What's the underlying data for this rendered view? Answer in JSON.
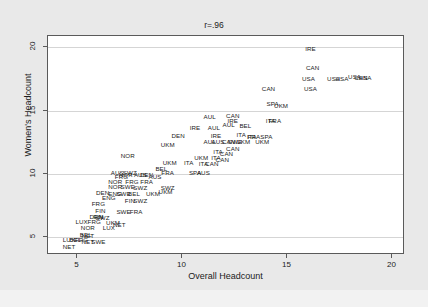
{
  "chart_data": {
    "type": "scatter",
    "title": "r=.96",
    "xlabel": "Overall Headcount",
    "ylabel": "Women's Headcount",
    "xlim": [
      3.6,
      20.6
    ],
    "ylim": [
      3.6,
      20.9
    ],
    "xticks": [
      5,
      10,
      15,
      20
    ],
    "yticks": [
      5,
      10,
      15,
      20
    ],
    "grid": true,
    "legend": "none",
    "marker_style": "text-label",
    "points": [
      {
        "label": "IRE",
        "x": 16.1,
        "y": 19.9
      },
      {
        "label": "CAN",
        "x": 16.2,
        "y": 18.4
      },
      {
        "label": "USA",
        "x": 16.0,
        "y": 17.5
      },
      {
        "label": "USA",
        "x": 17.2,
        "y": 17.5
      },
      {
        "label": "USA",
        "x": 17.6,
        "y": 17.5
      },
      {
        "label": "USA",
        "x": 18.2,
        "y": 17.7
      },
      {
        "label": "CAN",
        "x": 18.5,
        "y": 17.6
      },
      {
        "label": "USA",
        "x": 18.7,
        "y": 17.6
      },
      {
        "label": "CAN",
        "x": 14.1,
        "y": 16.7
      },
      {
        "label": "USA",
        "x": 16.1,
        "y": 16.7
      },
      {
        "label": "SPA",
        "x": 14.3,
        "y": 15.5
      },
      {
        "label": "UKM",
        "x": 14.7,
        "y": 15.4
      },
      {
        "label": "AUL",
        "x": 11.3,
        "y": 14.5
      },
      {
        "label": "CAN",
        "x": 12.4,
        "y": 14.6
      },
      {
        "label": "IRE",
        "x": 12.4,
        "y": 14.2
      },
      {
        "label": "ITA",
        "x": 14.2,
        "y": 14.2
      },
      {
        "label": "FRA",
        "x": 14.4,
        "y": 14.2
      },
      {
        "label": "IRE",
        "x": 10.6,
        "y": 13.6
      },
      {
        "label": "AUL",
        "x": 11.5,
        "y": 13.6
      },
      {
        "label": "AUL",
        "x": 12.2,
        "y": 13.9
      },
      {
        "label": "BEL",
        "x": 13.0,
        "y": 13.8
      },
      {
        "label": "DEN",
        "x": 9.8,
        "y": 13.0
      },
      {
        "label": "IRE",
        "x": 11.6,
        "y": 13.0
      },
      {
        "label": "ITA",
        "x": 12.8,
        "y": 13.1
      },
      {
        "label": "ITA",
        "x": 13.3,
        "y": 12.9
      },
      {
        "label": "FRA",
        "x": 13.4,
        "y": 12.9
      },
      {
        "label": "SPA",
        "x": 14.0,
        "y": 12.9
      },
      {
        "label": "AUL",
        "x": 11.3,
        "y": 12.5
      },
      {
        "label": "AUS",
        "x": 11.7,
        "y": 12.5
      },
      {
        "label": "CAN",
        "x": 12.2,
        "y": 12.5
      },
      {
        "label": "SWE",
        "x": 12.5,
        "y": 12.5
      },
      {
        "label": "UKM",
        "x": 12.9,
        "y": 12.5
      },
      {
        "label": "UKM",
        "x": 13.8,
        "y": 12.5
      },
      {
        "label": "UKM",
        "x": 9.3,
        "y": 12.3
      },
      {
        "label": "CAN",
        "x": 12.4,
        "y": 12.0
      },
      {
        "label": "ITA",
        "x": 11.7,
        "y": 11.7
      },
      {
        "label": "CAN",
        "x": 12.1,
        "y": 11.6
      },
      {
        "label": "NOR",
        "x": 7.4,
        "y": 11.4
      },
      {
        "label": "UKM",
        "x": 10.9,
        "y": 11.3
      },
      {
        "label": "ITA",
        "x": 11.6,
        "y": 11.3
      },
      {
        "label": "CAN",
        "x": 11.9,
        "y": 11.1
      },
      {
        "label": "UKM",
        "x": 9.4,
        "y": 10.9
      },
      {
        "label": "ITA",
        "x": 10.3,
        "y": 10.9
      },
      {
        "label": "ITA",
        "x": 11.0,
        "y": 10.8
      },
      {
        "label": "CAN",
        "x": 11.4,
        "y": 10.8
      },
      {
        "label": "BEL",
        "x": 9.0,
        "y": 10.4
      },
      {
        "label": "FRA",
        "x": 9.3,
        "y": 10.1
      },
      {
        "label": "SPA",
        "x": 10.6,
        "y": 10.1
      },
      {
        "label": "AUS",
        "x": 11.0,
        "y": 10.1
      },
      {
        "label": "AUS",
        "x": 6.9,
        "y": 10.1
      },
      {
        "label": "SWZ",
        "x": 7.5,
        "y": 10.1
      },
      {
        "label": "FRG",
        "x": 7.1,
        "y": 9.8
      },
      {
        "label": "NOR",
        "x": 7.3,
        "y": 9.9
      },
      {
        "label": "AUS",
        "x": 8.0,
        "y": 9.9
      },
      {
        "label": "DEN",
        "x": 8.3,
        "y": 9.9
      },
      {
        "label": "AUS",
        "x": 8.7,
        "y": 9.8
      },
      {
        "label": "NOR",
        "x": 6.8,
        "y": 9.4
      },
      {
        "label": "FRG",
        "x": 7.6,
        "y": 9.4
      },
      {
        "label": "FRA",
        "x": 8.3,
        "y": 9.4
      },
      {
        "label": "NOR",
        "x": 6.8,
        "y": 9.0
      },
      {
        "label": "SWE",
        "x": 7.4,
        "y": 9.0
      },
      {
        "label": "SWZ",
        "x": 8.0,
        "y": 8.9
      },
      {
        "label": "SWZ",
        "x": 9.3,
        "y": 8.9
      },
      {
        "label": "DEN",
        "x": 6.2,
        "y": 8.5
      },
      {
        "label": "ENG",
        "x": 6.8,
        "y": 8.4
      },
      {
        "label": "SWE",
        "x": 7.2,
        "y": 8.4
      },
      {
        "label": "BEL",
        "x": 7.7,
        "y": 8.4
      },
      {
        "label": "UKM",
        "x": 8.6,
        "y": 8.4
      },
      {
        "label": "UKM",
        "x": 9.2,
        "y": 8.6
      },
      {
        "label": "ENG",
        "x": 6.5,
        "y": 8.1
      },
      {
        "label": "FIN",
        "x": 7.5,
        "y": 7.9
      },
      {
        "label": "SWZ",
        "x": 8.0,
        "y": 7.9
      },
      {
        "label": "FRG",
        "x": 6.0,
        "y": 7.6
      },
      {
        "label": "FIN",
        "x": 6.1,
        "y": 7.1
      },
      {
        "label": "SWE",
        "x": 7.2,
        "y": 7.0
      },
      {
        "label": "FRA",
        "x": 7.8,
        "y": 7.0
      },
      {
        "label": "DEN",
        "x": 5.9,
        "y": 6.6
      },
      {
        "label": "FIN",
        "x": 6.0,
        "y": 6.6
      },
      {
        "label": "SWZ",
        "x": 6.2,
        "y": 6.5
      },
      {
        "label": "LUX",
        "x": 5.2,
        "y": 6.2
      },
      {
        "label": "FRG",
        "x": 5.8,
        "y": 6.2
      },
      {
        "label": "UKM",
        "x": 6.7,
        "y": 6.1
      },
      {
        "label": "NET",
        "x": 7.0,
        "y": 6.0
      },
      {
        "label": "NOR",
        "x": 5.5,
        "y": 5.7
      },
      {
        "label": "LUX",
        "x": 6.5,
        "y": 5.7
      },
      {
        "label": "BEL",
        "x": 5.4,
        "y": 5.2
      },
      {
        "label": "NET",
        "x": 5.5,
        "y": 5.1
      },
      {
        "label": "LUX",
        "x": 4.6,
        "y": 4.8
      },
      {
        "label": "BEL",
        "x": 4.9,
        "y": 4.8
      },
      {
        "label": "FRG",
        "x": 5.2,
        "y": 4.8
      },
      {
        "label": "NET",
        "x": 5.5,
        "y": 4.6
      },
      {
        "label": "SWE",
        "x": 6.0,
        "y": 4.6
      },
      {
        "label": "NET",
        "x": 4.6,
        "y": 4.2
      }
    ]
  },
  "axes": {
    "y_tick_labels": [
      "5",
      "10",
      "15",
      "20"
    ],
    "x_tick_labels": [
      "5",
      "10",
      "15",
      "20"
    ]
  }
}
